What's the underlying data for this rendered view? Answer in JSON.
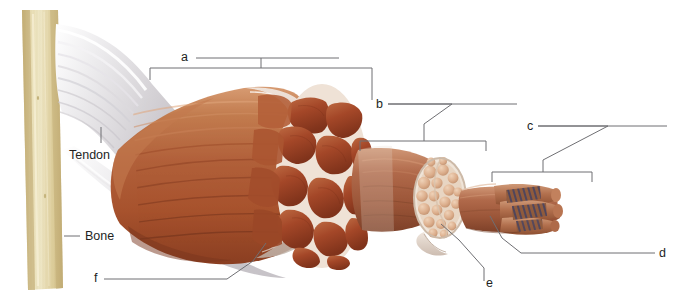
{
  "figure": {
    "type": "anatomical-diagram",
    "background_color": "#ffffff",
    "width": 682,
    "height": 298
  },
  "colors": {
    "bone": "#ded0a0",
    "bone_shadow": "#c8b781",
    "bone_highlight": "#efe6c4",
    "tendon": "#e9e7e8",
    "tendon_shadow": "#c9c6ca",
    "muscle_belly": "#b5663f",
    "muscle_belly_dark": "#8c4226",
    "muscle_belly_light": "#cf8b61",
    "fascicle": "#a24428",
    "fascicle_light": "#c06a43",
    "perimysium": "#e4d3c4",
    "epimysium": "#d8cfc8",
    "fiber_cylinder": "#a8654a",
    "fiber_cylinder_light": "#c78a68",
    "fiber_cross": "#dbb093",
    "myofibril": "#b5714f",
    "striation": "#4a4a6a",
    "leader_line": "#6f6f73",
    "text": "#231f1e"
  },
  "labels": {
    "letters": [
      {
        "id": "a",
        "text": "a",
        "x": 181,
        "y": 51
      },
      {
        "id": "b",
        "text": "b",
        "x": 376,
        "y": 98
      },
      {
        "id": "c",
        "text": "c",
        "x": 527,
        "y": 120
      },
      {
        "id": "d",
        "text": "d",
        "x": 659,
        "y": 247
      },
      {
        "id": "e",
        "text": "e",
        "x": 486,
        "y": 277
      },
      {
        "id": "f",
        "text": "f",
        "x": 94,
        "y": 272
      }
    ],
    "words": [
      {
        "id": "tendon",
        "text": "Tendon",
        "x": 69,
        "y": 149
      },
      {
        "id": "bone",
        "text": "Bone",
        "x": 85,
        "y": 230
      }
    ]
  },
  "leaders": {
    "a": {
      "label_line": "M196 58 H339",
      "bracket": "M150 68 H372 M150 68 V80 M372 68 V100 M261 68 V58",
      "description": "bracket spanning whole muscle belly"
    },
    "b": {
      "label_line": "M388 104 H517",
      "elbow": "M388 104 H452 L455 112 L424 124 L424 140",
      "bracket": "M360 141 H486 M360 141 V150 M486 141 V150 M424 141 V124",
      "description": "bracket spanning one fascicle"
    },
    "c": {
      "label_line": "M538 126 H667",
      "elbow": "M538 126 H610 L612 134 L543 160 L543 172",
      "bracket": "M492 172 H592 M492 172 V181 M592 172 V181 M543 172 V160",
      "description": "bracket spanning one muscle fiber"
    },
    "d": {
      "line": "M655 253 H521 L502 238 L490 216",
      "description": "points to myofibril inside muscle fiber"
    },
    "e": {
      "line": "M484 281 V268 L459 240 L441 224",
      "description": "points to endomysium around fiber"
    },
    "f": {
      "line": "M104 279 H227 L253 261 L266 243",
      "description": "points to epimysium sheath"
    },
    "tendon": {
      "line": "M101 127 V143",
      "description": "vertical tick to tendon"
    },
    "bone": {
      "line": "M64 236 H80",
      "description": "horizontal tick to bone"
    }
  },
  "structures": [
    {
      "name": "bone",
      "label": "Bone"
    },
    {
      "name": "tendon",
      "label": "Tendon"
    },
    {
      "name": "muscle-belly",
      "label": "a"
    },
    {
      "name": "fascicle",
      "label": "b"
    },
    {
      "name": "muscle-fiber",
      "label": "c"
    },
    {
      "name": "myofibril",
      "label": "d"
    },
    {
      "name": "endomysium",
      "label": "e"
    },
    {
      "name": "epimysium",
      "label": "f"
    }
  ]
}
